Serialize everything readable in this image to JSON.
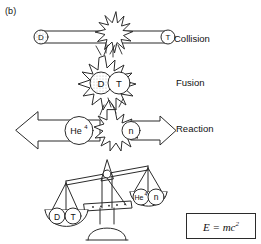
{
  "figure": {
    "panel_label": "(b)",
    "background_color": "#ffffff",
    "line_color": "#2b2b2b",
    "particle_fill_shaded": "#e8e8e8",
    "particle_fill_plain": "#ffffff"
  },
  "stages": [
    {
      "name": "collision",
      "label": "Collision",
      "particles": [
        {
          "id": "deuterium",
          "symbol": "D",
          "shaded": true
        },
        {
          "id": "tritium",
          "symbol": "T",
          "shaded": false
        }
      ],
      "burst": true
    },
    {
      "name": "fusion",
      "label": "Fusion",
      "particles": [
        {
          "id": "deuterium",
          "symbol": "D",
          "shaded": true
        },
        {
          "id": "tritium",
          "symbol": "T",
          "shaded": false
        }
      ],
      "burst": true
    },
    {
      "name": "reaction",
      "label": "Reaction",
      "particles": [
        {
          "id": "helium-4",
          "symbol": "He",
          "superscript": "4",
          "shaded": false
        },
        {
          "id": "neutron",
          "symbol": "n",
          "shaded": false
        }
      ],
      "burst": true
    }
  ],
  "balance": {
    "left_pan": {
      "name": "reactants-pan",
      "items": [
        {
          "id": "deuterium",
          "symbol": "D"
        },
        {
          "id": "tritium",
          "symbol": "T"
        }
      ],
      "side": "down"
    },
    "right_pan": {
      "name": "products-pan",
      "items": [
        {
          "id": "helium-4",
          "symbol": "He",
          "superscript": "4"
        },
        {
          "id": "neutron",
          "symbol": "n"
        }
      ],
      "side": "up"
    }
  },
  "equation": {
    "text_plain": "E = mc2",
    "lhs": "E",
    "operator": "=",
    "rhs_base": "mc",
    "rhs_exponent": "2"
  }
}
